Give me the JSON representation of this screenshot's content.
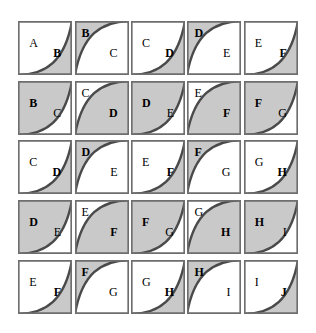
{
  "figure": {
    "title": "",
    "type": "diagram-grid",
    "rows": 5,
    "cols": 5,
    "background_color": "#ffffff",
    "shade_color": "#c9c9c9",
    "white_color": "#ffffff",
    "stroke_color": "#4a4a4a",
    "border_color": "#6e6e6e",
    "label_color": "#000000"
  },
  "cells": [
    {
      "row": 0,
      "col": 1,
      "upper_left_label": "A",
      "lower_right_label": "B",
      "curve": "concave-up",
      "shaded_region": "lower-right",
      "ul_bold": false,
      "lr_bold": true,
      "ul_pos": "mid",
      "lr_pos": "mid"
    },
    {
      "row": 0,
      "col": 2,
      "upper_left_label": "B",
      "lower_right_label": "C",
      "curve": "concave-down",
      "shaded_region": "upper-left",
      "ul_bold": true,
      "lr_bold": false,
      "ul_pos": "corner",
      "lr_pos": "mid"
    },
    {
      "row": 0,
      "col": 3,
      "upper_left_label": "C",
      "lower_right_label": "D",
      "curve": "concave-up",
      "shaded_region": "lower-right",
      "ul_bold": false,
      "lr_bold": true,
      "ul_pos": "mid",
      "lr_pos": "mid"
    },
    {
      "row": 0,
      "col": 4,
      "upper_left_label": "D",
      "lower_right_label": "E",
      "curve": "concave-down",
      "shaded_region": "upper-left",
      "ul_bold": true,
      "lr_bold": false,
      "ul_pos": "corner",
      "lr_pos": "mid"
    },
    {
      "row": 0,
      "col": 5,
      "upper_left_label": "E",
      "lower_right_label": "F",
      "curve": "concave-up",
      "shaded_region": "lower-right",
      "ul_bold": false,
      "lr_bold": true,
      "ul_pos": "mid",
      "lr_pos": "mid"
    },
    {
      "row": 1,
      "col": 1,
      "upper_left_label": "B",
      "lower_right_label": "C",
      "curve": "concave-up",
      "shaded_region": "upper-left",
      "ul_bold": true,
      "lr_bold": false,
      "ul_pos": "mid",
      "lr_pos": "mid"
    },
    {
      "row": 1,
      "col": 2,
      "upper_left_label": "C",
      "lower_right_label": "D",
      "curve": "concave-down",
      "shaded_region": "lower-right",
      "ul_bold": false,
      "lr_bold": true,
      "ul_pos": "corner",
      "lr_pos": "mid"
    },
    {
      "row": 1,
      "col": 3,
      "upper_left_label": "D",
      "lower_right_label": "E",
      "curve": "concave-up",
      "shaded_region": "upper-left",
      "ul_bold": true,
      "lr_bold": false,
      "ul_pos": "mid",
      "lr_pos": "mid"
    },
    {
      "row": 1,
      "col": 4,
      "upper_left_label": "E",
      "lower_right_label": "F",
      "curve": "concave-down",
      "shaded_region": "lower-right",
      "ul_bold": false,
      "lr_bold": true,
      "ul_pos": "corner",
      "lr_pos": "mid"
    },
    {
      "row": 1,
      "col": 5,
      "upper_left_label": "F",
      "lower_right_label": "G",
      "curve": "concave-up",
      "shaded_region": "upper-left",
      "ul_bold": true,
      "lr_bold": false,
      "ul_pos": "mid",
      "lr_pos": "mid"
    },
    {
      "row": 2,
      "col": 1,
      "upper_left_label": "C",
      "lower_right_label": "D",
      "curve": "concave-up",
      "shaded_region": "lower-right",
      "ul_bold": false,
      "lr_bold": true,
      "ul_pos": "mid",
      "lr_pos": "mid"
    },
    {
      "row": 2,
      "col": 2,
      "upper_left_label": "D",
      "lower_right_label": "E",
      "curve": "concave-down",
      "shaded_region": "upper-left",
      "ul_bold": true,
      "lr_bold": false,
      "ul_pos": "corner",
      "lr_pos": "mid"
    },
    {
      "row": 2,
      "col": 3,
      "upper_left_label": "E",
      "lower_right_label": "F",
      "curve": "concave-up",
      "shaded_region": "lower-right",
      "ul_bold": false,
      "lr_bold": true,
      "ul_pos": "mid",
      "lr_pos": "mid"
    },
    {
      "row": 2,
      "col": 4,
      "upper_left_label": "F",
      "lower_right_label": "G",
      "curve": "concave-down",
      "shaded_region": "upper-left",
      "ul_bold": true,
      "lr_bold": false,
      "ul_pos": "corner",
      "lr_pos": "mid"
    },
    {
      "row": 2,
      "col": 5,
      "upper_left_label": "G",
      "lower_right_label": "H",
      "curve": "concave-up",
      "shaded_region": "lower-right",
      "ul_bold": false,
      "lr_bold": true,
      "ul_pos": "mid",
      "lr_pos": "mid"
    },
    {
      "row": 3,
      "col": 1,
      "upper_left_label": "D",
      "lower_right_label": "E",
      "curve": "concave-up",
      "shaded_region": "upper-left",
      "ul_bold": true,
      "lr_bold": false,
      "ul_pos": "mid",
      "lr_pos": "mid"
    },
    {
      "row": 3,
      "col": 2,
      "upper_left_label": "E",
      "lower_right_label": "F",
      "curve": "concave-down",
      "shaded_region": "lower-right",
      "ul_bold": false,
      "lr_bold": true,
      "ul_pos": "corner",
      "lr_pos": "mid"
    },
    {
      "row": 3,
      "col": 3,
      "upper_left_label": "F",
      "lower_right_label": "G",
      "curve": "concave-up",
      "shaded_region": "upper-left",
      "ul_bold": true,
      "lr_bold": false,
      "ul_pos": "mid",
      "lr_pos": "mid"
    },
    {
      "row": 3,
      "col": 4,
      "upper_left_label": "G",
      "lower_right_label": "H",
      "curve": "concave-down",
      "shaded_region": "lower-right",
      "ul_bold": false,
      "lr_bold": true,
      "ul_pos": "corner",
      "lr_pos": "mid"
    },
    {
      "row": 3,
      "col": 5,
      "upper_left_label": "H",
      "lower_right_label": "I",
      "curve": "concave-up",
      "shaded_region": "upper-left",
      "ul_bold": true,
      "lr_bold": false,
      "ul_pos": "mid",
      "lr_pos": "mid"
    },
    {
      "row": 4,
      "col": 1,
      "upper_left_label": "E",
      "lower_right_label": "F",
      "curve": "concave-up",
      "shaded_region": "lower-right",
      "ul_bold": false,
      "lr_bold": true,
      "ul_pos": "mid",
      "lr_pos": "mid"
    },
    {
      "row": 4,
      "col": 2,
      "upper_left_label": "F",
      "lower_right_label": "G",
      "curve": "concave-down",
      "shaded_region": "upper-left",
      "ul_bold": true,
      "lr_bold": false,
      "ul_pos": "corner",
      "lr_pos": "mid"
    },
    {
      "row": 4,
      "col": 3,
      "upper_left_label": "G",
      "lower_right_label": "H",
      "curve": "concave-up",
      "shaded_region": "lower-right",
      "ul_bold": false,
      "lr_bold": true,
      "ul_pos": "mid",
      "lr_pos": "mid"
    },
    {
      "row": 4,
      "col": 4,
      "upper_left_label": "H",
      "lower_right_label": "I",
      "curve": "concave-down",
      "shaded_region": "upper-left",
      "ul_bold": true,
      "lr_bold": false,
      "ul_pos": "corner",
      "lr_pos": "mid"
    },
    {
      "row": 4,
      "col": 5,
      "upper_left_label": "I",
      "lower_right_label": "J",
      "curve": "concave-up",
      "shaded_region": "lower-right",
      "ul_bold": false,
      "lr_bold": true,
      "ul_pos": "mid",
      "lr_pos": "mid"
    }
  ]
}
